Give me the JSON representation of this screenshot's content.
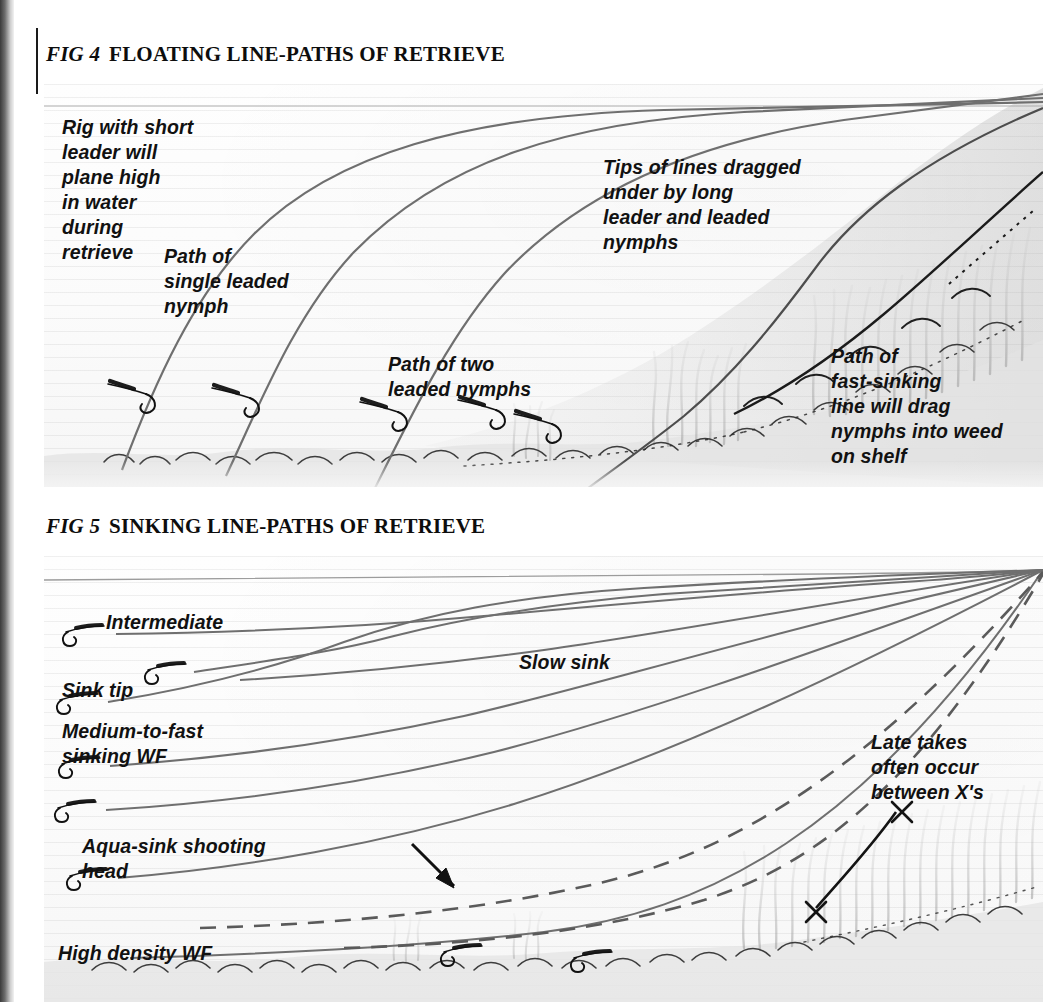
{
  "figures": [
    {
      "id": "fig4",
      "fig_label": "FIG 4",
      "title": "FLOATING LINE-PATHS OF RETRIEVE",
      "annotations": [
        {
          "name": "short-leader-note",
          "text": "Rig with short\nleader will\nplane high\nin water\nduring\nretrieve"
        },
        {
          "name": "single-nymph-note",
          "text": "Path of\nsingle leaded\nnymph"
        },
        {
          "name": "two-nymphs-note",
          "text": "Path of two\nleaded nymphs"
        },
        {
          "name": "dragged-tips-note",
          "text": "Tips of lines dragged\nunder by long\nleader and leaded\nnymphs"
        },
        {
          "name": "fast-sinking-note",
          "text": "Path of\nfast-sinking\nline will drag\nnymphs into weed\non shelf"
        }
      ]
    },
    {
      "id": "fig5",
      "fig_label": "FIG 5",
      "title": "SINKING LINE-PATHS OF RETRIEVE",
      "annotations": [
        {
          "name": "intermediate-line-label",
          "text": "Intermediate"
        },
        {
          "name": "sink-tip-line-label",
          "text": "Sink tip"
        },
        {
          "name": "medium-fast-line-label",
          "text": "Medium-to-fast\nsinking WF"
        },
        {
          "name": "aqua-sink-line-label",
          "text": "Aqua-sink shooting\nhead"
        },
        {
          "name": "slow-sink-line-label",
          "text": "Slow sink"
        },
        {
          "name": "high-density-line-label",
          "text": "High density WF"
        },
        {
          "name": "late-takes-note",
          "text": "Late takes\noften occur\nbetween X's"
        }
      ]
    }
  ],
  "colors": {
    "line": "#6b6b6b",
    "dark_line": "#151515",
    "weed": "#b9b9b9",
    "bed": "#8f8f8f",
    "text": "#111111",
    "paper": "#fdfdfd"
  },
  "symbols": {
    "nymph_hook": "fly-hook",
    "take_mark": "X",
    "retrieve_arrow": "arrow"
  }
}
